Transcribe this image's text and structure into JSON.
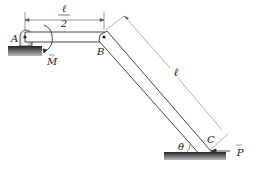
{
  "diagram": {
    "points": {
      "A": "A",
      "B": "B",
      "C": "C"
    },
    "dimensions": {
      "ab_length_num": "ℓ",
      "ab_length_den": "2",
      "bc_length": "ℓ"
    },
    "loads": {
      "moment": "M",
      "force": "P"
    },
    "angle": "θ",
    "colors": {
      "bar_outline": "#333333",
      "ground": "#444444",
      "dimension_line": "#555555"
    }
  }
}
